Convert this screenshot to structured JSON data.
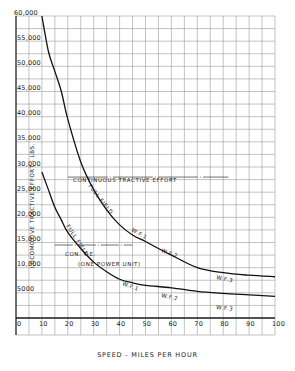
{
  "chart_data": {
    "type": "line",
    "title": "",
    "xlabel": "SPEED - MILES PER HOUR",
    "ylabel": "LOCOMOTIVE TRACTIVE EFFORT - LBS.",
    "xlim": [
      0,
      100
    ],
    "ylim": [
      0,
      60000
    ],
    "x_ticks": [
      "0",
      "10",
      "20",
      "30",
      "40",
      "50",
      "60",
      "70",
      "80",
      "90",
      "100"
    ],
    "y_ticks": [
      "5000",
      "10,000",
      "15,000",
      "20,000",
      "25,000",
      "30,000",
      "35,000",
      "40,000",
      "45,000",
      "50,000",
      "55,000",
      "60,000"
    ],
    "grid": true,
    "legend": "none (curves labelled inline)",
    "series": [
      {
        "name": "Upper curve (two power units)",
        "labels": [
          "FULL FIELD",
          "W.F.1",
          "W.F.2",
          "W.F.3"
        ],
        "x": [
          10,
          12.5,
          15,
          17.5,
          20,
          25,
          30,
          35,
          40,
          45,
          50,
          55,
          60,
          70,
          80,
          90,
          100
        ],
        "y": [
          60000,
          53000,
          49000,
          45000,
          39500,
          31000,
          25500,
          21500,
          18500,
          16500,
          15200,
          13800,
          12500,
          10000,
          9000,
          8500,
          8200
        ]
      },
      {
        "name": "Lower curve (one power unit)",
        "labels": [
          "FULL FIELD",
          "W.F.1",
          "W.F.2",
          "W.F.3"
        ],
        "x": [
          10,
          12.5,
          15,
          17.5,
          20,
          25,
          30,
          35,
          40,
          45,
          50,
          60,
          70,
          80,
          90,
          100
        ],
        "y": [
          29000,
          25500,
          22000,
          19500,
          17000,
          13800,
          11100,
          9200,
          7700,
          7000,
          6500,
          6000,
          5300,
          4900,
          4600,
          4300
        ]
      }
    ],
    "annotations": [
      {
        "text": "CONTINUOUS TRACTIVE EFFORT",
        "x": [
          20,
          82
        ],
        "y": 28000,
        "kind": "reference-line"
      },
      {
        "text": "CON. T.E.",
        "x": [
          15,
          45
        ],
        "y": 14500,
        "kind": "reference-line"
      },
      {
        "text": "(ONE POWER UNIT)",
        "x": 30,
        "y": 13000,
        "kind": "note"
      }
    ]
  },
  "axis": {
    "x_label": "SPEED - MILES PER HOUR",
    "y_label": "LOCOMOTIVE   TRACTIVE   EFFORT - LBS."
  },
  "labels": {
    "upper_full_field": "FULL FIELD",
    "upper_wf1": "W.F.1",
    "upper_wf2": "W.F.2",
    "upper_wf3": "W.F.3",
    "lower_full_field": "FULL FIELD",
    "lower_wf1": "W.F.1",
    "lower_wf2": "W.F.2",
    "lower_wf3": "W.F.3",
    "continuous": "CONTINUOUS   TRACTIVE   EFFORT",
    "con_te": "CON. T.E.",
    "one_power_unit": "(ONE  POWER UNIT)"
  }
}
